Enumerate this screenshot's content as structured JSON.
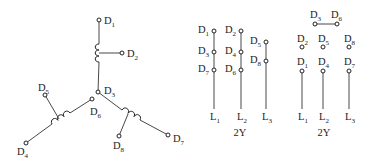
{
  "diagram": {
    "star_winding": {
      "center": {
        "label": "D",
        "sub": "3",
        "x": 98,
        "y": 92
      },
      "terminals": [
        {
          "id": "D1",
          "label": "D",
          "sub": "1",
          "x": 99,
          "y": 20,
          "lx": 104,
          "ly": 24
        },
        {
          "id": "D2",
          "label": "D",
          "sub": "2",
          "x": 122,
          "y": 53,
          "lx": 127,
          "ly": 57
        },
        {
          "id": "D3",
          "label": "D",
          "sub": "3",
          "x": 98,
          "y": 92,
          "lx": 104,
          "ly": 94
        },
        {
          "id": "D4",
          "label": "D",
          "sub": "4",
          "x": 26,
          "y": 143,
          "lx": 17,
          "ly": 155
        },
        {
          "id": "D5",
          "label": "D",
          "sub": "5",
          "x": 45,
          "y": 95,
          "lx": 38,
          "ly": 91
        },
        {
          "id": "D6",
          "label": "D",
          "sub": "6",
          "x": 92,
          "y": 99,
          "lx": 90,
          "ly": 115
        },
        {
          "id": "D7",
          "label": "D",
          "sub": "7",
          "x": 168,
          "y": 135,
          "lx": 173,
          "ly": 142
        },
        {
          "id": "D8",
          "label": "D",
          "sub": "8",
          "x": 119,
          "y": 136,
          "lx": 113,
          "ly": 149
        }
      ]
    },
    "connection_a": {
      "caption": "2Y",
      "columns": [
        {
          "line": "L",
          "sub": "1",
          "x": 214,
          "top": 31,
          "terminals": [
            {
              "label": "D",
              "sub": "1",
              "y": 31
            },
            {
              "label": "D",
              "sub": "3",
              "y": 52
            },
            {
              "label": "D",
              "sub": "7",
              "y": 70
            }
          ]
        },
        {
          "line": "L",
          "sub": "2",
          "x": 241,
          "top": 31,
          "terminals": [
            {
              "label": "D",
              "sub": "2",
              "y": 31
            },
            {
              "label": "D",
              "sub": "4",
              "y": 52
            },
            {
              "label": "D",
              "sub": "6",
              "y": 70
            }
          ]
        },
        {
          "line": "L",
          "sub": "3",
          "x": 266,
          "top": 42,
          "terminals": [
            {
              "label": "D",
              "sub": "5",
              "y": 42
            },
            {
              "label": "D",
              "sub": "8",
              "y": 61
            }
          ]
        }
      ]
    },
    "connection_b": {
      "caption": "2Y",
      "link": {
        "from": {
          "label": "D",
          "sub": "3",
          "x": 315,
          "y": 24
        },
        "to": {
          "label": "D",
          "sub": "6",
          "x": 337,
          "y": 24
        }
      },
      "columns": [
        {
          "line": "L",
          "sub": "1",
          "x": 302,
          "open": {
            "label": "D",
            "sub": "2",
            "y": 47
          },
          "term": {
            "label": "D",
            "sub": "1",
            "y": 71
          }
        },
        {
          "line": "L",
          "sub": "2",
          "x": 323,
          "open": {
            "label": "D",
            "sub": "5",
            "y": 47
          },
          "term": {
            "label": "D",
            "sub": "4",
            "y": 71
          }
        },
        {
          "line": "L",
          "sub": "3",
          "x": 349,
          "open": {
            "label": "D",
            "sub": "8",
            "y": 47
          },
          "term": {
            "label": "D",
            "sub": "7",
            "y": 71
          }
        }
      ]
    },
    "line_end_y": 109,
    "line_label_y": 120,
    "caption_y": 136
  }
}
